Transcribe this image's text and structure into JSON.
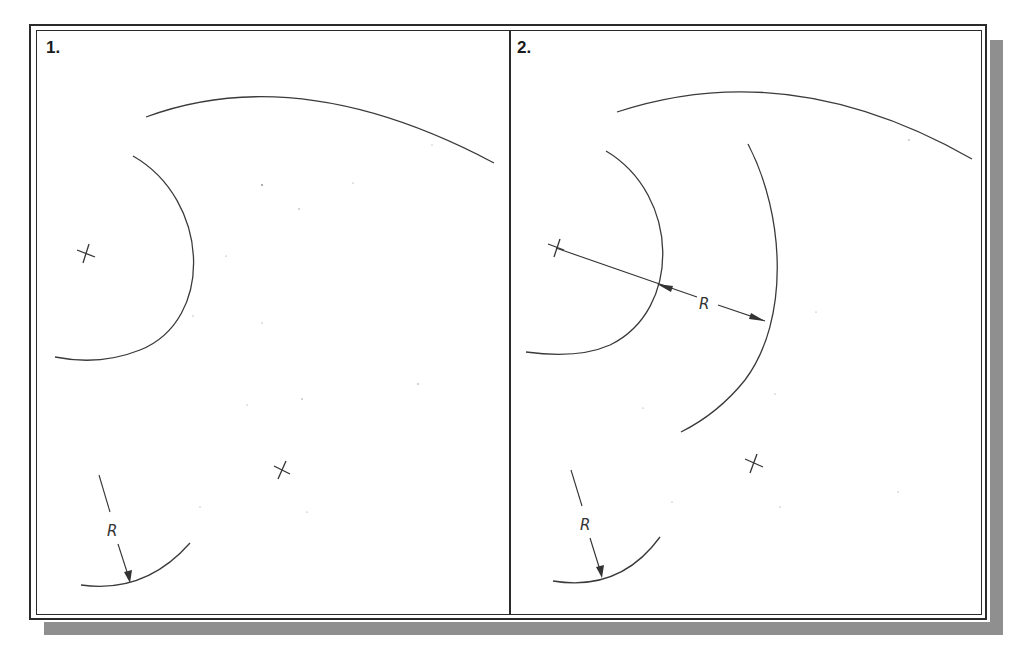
{
  "figure": {
    "type": "cad-fillet-construction-diagram",
    "panels": [
      {
        "label": "1.",
        "description": "Two existing arcs and two center marks; a fillet radius R is indicated on a small arc",
        "elements": {
          "top_arc": "large arc across top",
          "left_arc": "semicircular arc with center mark",
          "center_marks": 2,
          "radius_indicator": {
            "text": "R"
          }
        }
      },
      {
        "label": "2.",
        "description": "Offset construction arc drawn at distance R from the left arc, dimensioned with R",
        "elements": {
          "top_arc": "large arc across top",
          "left_arc": "semicircular arc with center mark",
          "offset_arc": "construction arc offset by R",
          "dimension": {
            "text": "R"
          },
          "center_marks": 2,
          "radius_indicator": {
            "text": "R"
          }
        }
      }
    ],
    "colors": {
      "line": "#3a3a3a",
      "frame": "#2a2a2a",
      "shadow": "#8f8f8f",
      "background": "#ffffff"
    }
  }
}
